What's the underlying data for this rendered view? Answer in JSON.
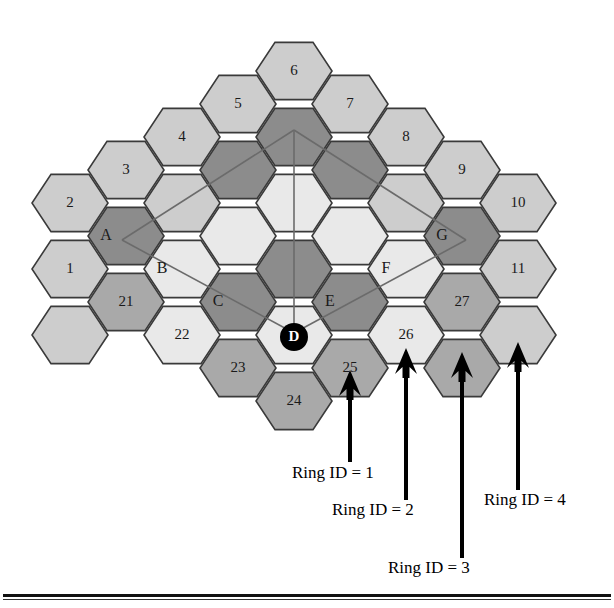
{
  "figure": {
    "type": "hexagonal-cell-ring-diagram",
    "center_label": "D",
    "colors": {
      "ring1_fill": "#e9e9e9",
      "ring2_fill": "#8c8c8c",
      "ring3_fill": "#cdcdcd",
      "ring4_fill": "#a9a9a9",
      "stroke": "#3a3a3a",
      "guide_line": "#6b6b6b",
      "arrow": "#000000",
      "center_marker": "#000000",
      "center_text": "#ffffff"
    }
  },
  "hexes": [
    {
      "label": "6",
      "cx": 294,
      "cy": 71,
      "ring": 4,
      "fill": "#cdcdcd"
    },
    {
      "label": "5",
      "cx": 238,
      "cy": 104,
      "ring": 4,
      "fill": "#cdcdcd"
    },
    {
      "label": "7",
      "cx": 350,
      "cy": 104,
      "ring": 4,
      "fill": "#cdcdcd"
    },
    {
      "label": "4",
      "cx": 182,
      "cy": 137,
      "ring": 4,
      "fill": "#cdcdcd"
    },
    {
      "label": "",
      "cx": 294,
      "cy": 137,
      "ring": 2,
      "fill": "#8c8c8c"
    },
    {
      "label": "8",
      "cx": 406,
      "cy": 137,
      "ring": 4,
      "fill": "#cdcdcd"
    },
    {
      "label": "3",
      "cx": 126,
      "cy": 170,
      "ring": 4,
      "fill": "#cdcdcd"
    },
    {
      "label": "",
      "cx": 238,
      "cy": 170,
      "ring": 2,
      "fill": "#8c8c8c"
    },
    {
      "label": "",
      "cx": 350,
      "cy": 170,
      "ring": 2,
      "fill": "#8c8c8c"
    },
    {
      "label": "9",
      "cx": 462,
      "cy": 170,
      "ring": 4,
      "fill": "#cdcdcd"
    },
    {
      "label": "2",
      "cx": 70,
      "cy": 203,
      "ring": 4,
      "fill": "#cdcdcd"
    },
    {
      "label": "",
      "cx": 182,
      "cy": 203,
      "ring": 3,
      "fill": "#cdcdcd"
    },
    {
      "label": "",
      "cx": 294,
      "cy": 203,
      "ring": 1,
      "fill": "#e9e9e9"
    },
    {
      "label": "",
      "cx": 406,
      "cy": 203,
      "ring": 3,
      "fill": "#cdcdcd"
    },
    {
      "label": "10",
      "cx": 518,
      "cy": 203,
      "ring": 4,
      "fill": "#cdcdcd"
    },
    {
      "label": "A",
      "cx": 126,
      "cy": 236,
      "ring": 2,
      "fill": "#8c8c8c"
    },
    {
      "label": "",
      "cx": 238,
      "cy": 236,
      "ring": 1,
      "fill": "#e9e9e9"
    },
    {
      "label": "",
      "cx": 350,
      "cy": 236,
      "ring": 1,
      "fill": "#e9e9e9"
    },
    {
      "label": "G",
      "cx": 462,
      "cy": 236,
      "ring": 2,
      "fill": "#8c8c8c"
    },
    {
      "label": "1",
      "cx": 70,
      "cy": 269,
      "ring": 4,
      "fill": "#cdcdcd"
    },
    {
      "label": "B",
      "cx": 182,
      "cy": 269,
      "ring": 3,
      "fill": "#e9e9e9"
    },
    {
      "label": "",
      "cx": 294,
      "cy": 269,
      "ring": 2,
      "fill": "#8c8c8c"
    },
    {
      "label": "F",
      "cx": 406,
      "cy": 269,
      "ring": 3,
      "fill": "#e9e9e9"
    },
    {
      "label": "11",
      "cx": 518,
      "cy": 269,
      "ring": 4,
      "fill": "#cdcdcd"
    },
    {
      "label": "21",
      "cx": 126,
      "cy": 302,
      "ring": 4,
      "fill": "#a9a9a9"
    },
    {
      "label": "C",
      "cx": 238,
      "cy": 302,
      "ring": 2,
      "fill": "#8c8c8c"
    },
    {
      "label": "E",
      "cx": 350,
      "cy": 302,
      "ring": 2,
      "fill": "#8c8c8c"
    },
    {
      "label": "27",
      "cx": 462,
      "cy": 302,
      "ring": 4,
      "fill": "#a9a9a9"
    },
    {
      "label": "",
      "cx": 70,
      "cy": 335,
      "ring": 4,
      "fill": "#cdcdcd"
    },
    {
      "label": "22",
      "cx": 182,
      "cy": 335,
      "ring": 3,
      "fill": "#e9e9e9"
    },
    {
      "label": "D",
      "cx": 294,
      "cy": 335,
      "ring": 1,
      "fill": "#e9e9e9"
    },
    {
      "label": "26",
      "cx": 406,
      "cy": 335,
      "ring": 3,
      "fill": "#e9e9e9"
    },
    {
      "label": "",
      "cx": 518,
      "cy": 335,
      "ring": 4,
      "fill": "#cdcdcd"
    },
    {
      "label": "23",
      "cx": 238,
      "cy": 368,
      "ring": 4,
      "fill": "#a9a9a9"
    },
    {
      "label": "25",
      "cx": 350,
      "cy": 368,
      "ring": 4,
      "fill": "#a9a9a9"
    },
    {
      "label": "",
      "cx": 462,
      "cy": 368,
      "ring": 4,
      "fill": "#a9a9a9"
    },
    {
      "label": "24",
      "cx": 294,
      "cy": 401,
      "ring": 4,
      "fill": "#a9a9a9"
    }
  ],
  "guides": {
    "apex": {
      "x": 294,
      "y": 130
    },
    "left_vertex": {
      "x": 122,
      "y": 240
    },
    "right_vertex": {
      "x": 466,
      "y": 240
    },
    "center": {
      "x": 294,
      "y": 333
    }
  },
  "arrows": [
    {
      "id": "ring1",
      "tip_x": 350,
      "tip_y": 370,
      "tail_y": 462,
      "label": "Ring ID = 1",
      "label_x": 292,
      "label_y": 463
    },
    {
      "id": "ring2",
      "tip_x": 406,
      "tip_y": 348,
      "tail_y": 500,
      "label": "Ring ID = 2",
      "label_x": 332,
      "label_y": 500
    },
    {
      "id": "ring3",
      "tip_x": 462,
      "tip_y": 352,
      "tail_y": 558,
      "label": "Ring ID = 3",
      "label_x": 388,
      "label_y": 558
    },
    {
      "id": "ring4",
      "tip_x": 518,
      "tip_y": 342,
      "tail_y": 490,
      "label": "Ring ID = 4",
      "label_x": 484,
      "label_y": 490
    }
  ]
}
